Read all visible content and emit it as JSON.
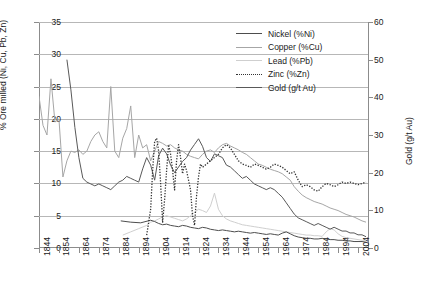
{
  "chart_data": {
    "type": "line",
    "title": "",
    "xlabel": "",
    "ylabel": "% Ore milled (Ni, Cu, Pb, Zn)",
    "ylabel_secondary": "Gold (g/t Au)",
    "xlim": [
      1844,
      2009
    ],
    "ylim": [
      0,
      35
    ],
    "ylim_secondary": [
      0,
      60
    ],
    "grid": true,
    "legend_position": "top-right",
    "xticks": [
      1844,
      1854,
      1864,
      1874,
      1884,
      1894,
      1904,
      1914,
      1924,
      1934,
      1944,
      1954,
      1964,
      1974,
      1984,
      1994,
      2004
    ],
    "yticks": [
      0,
      5,
      10,
      15,
      20,
      25,
      30,
      35
    ],
    "yticks_secondary": [
      0,
      10,
      20,
      30,
      40,
      50,
      60
    ],
    "series": [
      {
        "name": "Nickel (%Ni)",
        "legend_label": "Nickel (%Ni)",
        "color": "#4d4d4d",
        "style": "solid",
        "axis": "left",
        "x": [
          1885,
          1890,
          1895,
          1900,
          1902,
          1904,
          1906,
          1908,
          1910,
          1912,
          1914,
          1916,
          1918,
          1920,
          1922,
          1924,
          1926,
          1928,
          1930,
          1932,
          1934,
          1936,
          1938,
          1940,
          1942,
          1944,
          1946,
          1948,
          1950,
          1952,
          1954,
          1956,
          1958,
          1960,
          1962,
          1964,
          1966,
          1968,
          1970,
          1972,
          1974,
          1976,
          1978,
          1980,
          1982,
          1984,
          1986,
          1988,
          1990,
          1992,
          1994,
          1996,
          1998,
          2000,
          2002,
          2004,
          2006,
          2008
        ],
        "values": [
          4.2,
          4.0,
          3.9,
          4.3,
          4.1,
          3.8,
          3.6,
          3.7,
          3.5,
          3.4,
          3.3,
          3.5,
          3.4,
          3.2,
          3.1,
          3.0,
          3.2,
          3.1,
          2.9,
          2.8,
          2.7,
          2.8,
          2.7,
          2.6,
          2.5,
          2.6,
          2.5,
          2.4,
          2.3,
          2.4,
          2.3,
          2.2,
          2.1,
          2.2,
          2.1,
          2.0,
          2.3,
          2.5,
          2.2,
          1.9,
          1.7,
          1.6,
          1.5,
          1.5,
          1.4,
          1.4,
          1.5,
          1.4,
          1.3,
          1.3,
          1.2,
          1.2,
          1.1,
          1.1,
          1.0,
          1.0,
          1.0,
          0.9
        ]
      },
      {
        "name": "Copper (%Cu)",
        "legend_label": "Copper (%Cu)",
        "color": "#a6a6a6",
        "style": "solid",
        "axis": "left",
        "x": [
          1844,
          1846,
          1848,
          1850,
          1852,
          1854,
          1856,
          1858,
          1860,
          1862,
          1864,
          1866,
          1868,
          1870,
          1872,
          1874,
          1876,
          1878,
          1880,
          1882,
          1884,
          1886,
          1888,
          1890,
          1892,
          1894,
          1896,
          1898,
          1900,
          1902,
          1904,
          1906,
          1908,
          1910,
          1912,
          1914,
          1916,
          1918,
          1920,
          1922,
          1924,
          1926,
          1928,
          1930,
          1932,
          1934,
          1936,
          1938,
          1940,
          1942,
          1944,
          1946,
          1948,
          1950,
          1952,
          1954,
          1956,
          1958,
          1960,
          1962,
          1964,
          1966,
          1968,
          1970,
          1972,
          1974,
          1976,
          1978,
          1980,
          1982,
          1984,
          1986,
          1988,
          1990,
          1992,
          1994,
          1996,
          1998,
          2000,
          2002,
          2004,
          2006,
          2008
        ],
        "values": [
          23.5,
          19.0,
          17.5,
          26.2,
          19.5,
          20.0,
          11.0,
          13.5,
          15.0,
          14.8,
          15.2,
          14.5,
          15.0,
          16.5,
          17.5,
          18.0,
          16.5,
          15.5,
          25.0,
          15.0,
          14.0,
          17.0,
          18.5,
          22.0,
          14.0,
          17.5,
          15.5,
          16.0,
          13.5,
          15.0,
          16.5,
          16.2,
          15.8,
          16.0,
          15.5,
          15.2,
          15.0,
          14.5,
          14.2,
          14.0,
          13.8,
          14.5,
          15.0,
          15.2,
          14.8,
          15.5,
          16.0,
          16.2,
          15.8,
          15.5,
          15.2,
          14.8,
          14.5,
          14.0,
          13.5,
          13.0,
          12.8,
          12.5,
          12.2,
          12.0,
          11.8,
          11.5,
          11.0,
          10.5,
          9.5,
          8.8,
          8.2,
          7.8,
          7.5,
          7.2,
          7.0,
          6.8,
          6.5,
          6.2,
          6.0,
          5.8,
          5.5,
          5.2,
          5.0,
          4.8,
          4.5,
          4.2,
          4.0
        ]
      },
      {
        "name": "Lead (%Pb)",
        "legend_label": "Lead (%Pb)",
        "color": "#cfcfcf",
        "style": "solid",
        "axis": "left",
        "x": [
          1886,
          1890,
          1894,
          1898,
          1900,
          1902,
          1904,
          1906,
          1908,
          1910,
          1912,
          1914,
          1916,
          1918,
          1920,
          1922,
          1924,
          1926,
          1928,
          1930,
          1932,
          1934,
          1936,
          1938,
          1940,
          1942,
          1944,
          1946,
          1948,
          1950,
          1952,
          1954,
          1956,
          1958,
          1960,
          1962,
          1964,
          1966,
          1968,
          1970,
          1972,
          1974,
          1976,
          1978,
          1980,
          1982,
          1984,
          1986,
          1988,
          1990,
          1992,
          1994,
          1996,
          1998,
          2000,
          2002,
          2004,
          2006,
          2008
        ],
        "values": [
          2.0,
          2.5,
          3.0,
          3.5,
          4.0,
          4.2,
          4.5,
          4.8,
          5.0,
          4.8,
          4.6,
          4.4,
          4.2,
          4.5,
          5.0,
          5.5,
          6.0,
          5.8,
          5.5,
          6.5,
          8.5,
          6.0,
          5.0,
          4.5,
          4.2,
          4.0,
          3.8,
          3.6,
          3.5,
          3.4,
          3.3,
          3.2,
          3.1,
          3.0,
          2.9,
          2.8,
          2.7,
          2.6,
          2.5,
          2.4,
          2.3,
          2.2,
          2.1,
          2.0,
          2.0,
          1.9,
          1.9,
          1.8,
          2.5,
          3.0,
          2.8,
          2.2,
          1.8,
          1.6,
          1.5,
          1.4,
          1.3,
          1.2,
          1.2
        ]
      },
      {
        "name": "Zinc (%Zn)",
        "legend_label": "Zinc (%Zn)",
        "color": "#333333",
        "style": "dotted",
        "axis": "left",
        "x": [
          1898,
          1900,
          1901,
          1902,
          1903,
          1904,
          1905,
          1906,
          1907,
          1908,
          1909,
          1910,
          1911,
          1912,
          1913,
          1914,
          1915,
          1916,
          1917,
          1918,
          1919,
          1920,
          1921,
          1922,
          1923,
          1924,
          1925,
          1926,
          1928,
          1930,
          1932,
          1934,
          1936,
          1938,
          1940,
          1942,
          1944,
          1946,
          1948,
          1950,
          1952,
          1954,
          1956,
          1958,
          1960,
          1962,
          1964,
          1966,
          1968,
          1970,
          1972,
          1974,
          1976,
          1978,
          1980,
          1982,
          1984,
          1986,
          1988,
          1990,
          1992,
          1994,
          1996,
          1998,
          2000,
          2002,
          2004,
          2006,
          2008
        ],
        "values": [
          2.0,
          6.0,
          12.0,
          16.5,
          17.0,
          15.0,
          10.0,
          4.0,
          7.5,
          12.0,
          16.0,
          14.5,
          12.0,
          9.0,
          13.5,
          16.0,
          14.0,
          11.5,
          13.0,
          12.0,
          10.5,
          9.0,
          5.0,
          3.5,
          8.0,
          11.0,
          13.0,
          12.5,
          13.0,
          13.5,
          14.0,
          14.5,
          15.5,
          16.0,
          15.5,
          14.5,
          13.5,
          13.0,
          12.8,
          12.5,
          13.0,
          12.8,
          12.5,
          12.2,
          12.5,
          13.0,
          12.8,
          12.5,
          12.0,
          11.5,
          11.8,
          10.5,
          9.5,
          9.8,
          9.5,
          9.0,
          8.8,
          9.5,
          10.0,
          9.8,
          9.5,
          9.8,
          10.2,
          10.0,
          10.2,
          10.0,
          9.8,
          10.0,
          10.2
        ]
      },
      {
        "name": "Gold (g/t Au)",
        "legend_label": "Gold (g/t Au)",
        "color": "#595959",
        "style": "solid",
        "axis": "right",
        "x": [
          1858,
          1860,
          1862,
          1864,
          1866,
          1868,
          1870,
          1872,
          1874,
          1876,
          1878,
          1880,
          1882,
          1884,
          1886,
          1888,
          1890,
          1892,
          1894,
          1896,
          1898,
          1900,
          1902,
          1904,
          1906,
          1908,
          1910,
          1912,
          1914,
          1916,
          1918,
          1920,
          1922,
          1924,
          1926,
          1928,
          1930,
          1932,
          1934,
          1936,
          1938,
          1940,
          1942,
          1944,
          1946,
          1948,
          1950,
          1952,
          1954,
          1956,
          1958,
          1960,
          1962,
          1964,
          1966,
          1968,
          1970,
          1972,
          1974,
          1976,
          1978,
          1980,
          1982,
          1984,
          1986,
          1988,
          1990,
          1992,
          1994,
          1996,
          1998,
          2000,
          2002,
          2004,
          2006,
          2008
        ],
        "values": [
          50.0,
          42.0,
          32.0,
          24.0,
          18.5,
          17.5,
          17.0,
          16.5,
          17.0,
          16.5,
          16.0,
          15.5,
          16.5,
          17.5,
          18.0,
          19.0,
          18.5,
          18.0,
          17.5,
          21.0,
          24.0,
          22.0,
          18.0,
          24.5,
          26.5,
          25.0,
          22.0,
          20.0,
          21.5,
          23.0,
          24.0,
          26.0,
          27.5,
          29.0,
          27.0,
          24.0,
          23.0,
          25.0,
          24.5,
          24.0,
          22.0,
          21.5,
          20.5,
          19.5,
          18.5,
          19.0,
          18.0,
          17.0,
          16.5,
          16.0,
          15.5,
          16.0,
          15.5,
          14.5,
          13.5,
          12.0,
          10.5,
          9.0,
          8.0,
          7.5,
          7.0,
          6.5,
          6.0,
          6.5,
          6.0,
          5.5,
          5.0,
          5.5,
          5.0,
          4.5,
          4.5,
          4.0,
          4.0,
          3.5,
          3.5,
          3.0
        ]
      }
    ]
  },
  "axes": {
    "left_label": "% Ore milled (Ni, Cu, Pb, Zn)",
    "right_label": "Gold (g/t Au)"
  },
  "caption": ""
}
